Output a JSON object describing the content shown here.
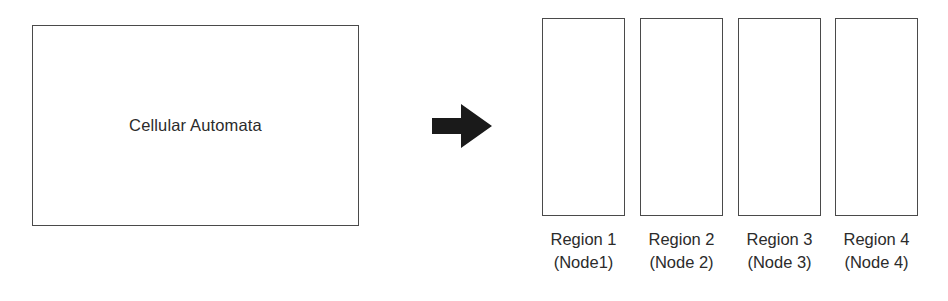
{
  "diagram": {
    "background_color": "#ffffff",
    "stroke_color": "#4a4a4a",
    "text_color": "#2b2b2b",
    "arrow_color": "#1a1a1a"
  },
  "source": {
    "label": "Cellular Automata"
  },
  "flow": {
    "arrow_icon": "right-arrow-icon",
    "direction": "right"
  },
  "regions": [
    {
      "name": "Region 1",
      "node": "(Node1)"
    },
    {
      "name": "Region 2",
      "node": "(Node 2)"
    },
    {
      "name": "Region 3",
      "node": "(Node 3)"
    },
    {
      "name": "Region 4",
      "node": "(Node 4)"
    }
  ]
}
